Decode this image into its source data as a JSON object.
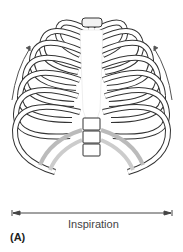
{
  "figure": {
    "panel_label": "(A)",
    "caption": "Inspiration",
    "annotations": {
      "side_arrows": "upward arrows on both sides indicating rib elevation",
      "width_arrow": "double-headed horizontal arrow indicating chest width expansion"
    },
    "colors": {
      "bone_fill": "#ffffff",
      "outline": "#333333",
      "cartilage_shade": "#d9d9d9",
      "arrow": "#555555"
    }
  }
}
